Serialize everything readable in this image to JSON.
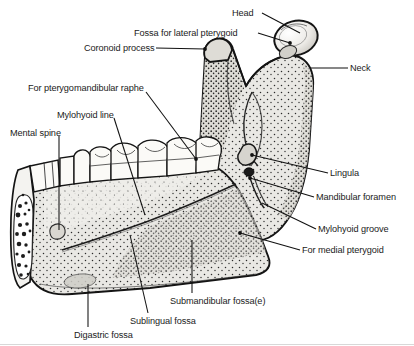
{
  "figure": {
    "view": "medial (lingual) surface of right half of mandible",
    "colors": {
      "background": "#ffffff",
      "ink": "#1b1b1b",
      "bone_fill": "#e8e7e3",
      "bone_fill_dark": "#cfcdc7",
      "tooth_fill": "#fbfaf7",
      "stipple": "#2a2a2a",
      "cancellous": "#1d1d1d",
      "border": "#d8d8d8"
    }
  },
  "labels": [
    {
      "id": "head",
      "text": "Head",
      "x": 232,
      "y": 8,
      "align": "left",
      "leader": [
        [
          262,
          13
        ],
        [
          300,
          33
        ]
      ]
    },
    {
      "id": "fossa-lateral-pterygoid",
      "text": "Fossa for lateral pterygoid",
      "x": 134,
      "y": 28,
      "align": "left",
      "leader": [
        [
          258,
          33
        ],
        [
          290,
          43
        ]
      ]
    },
    {
      "id": "coronoid-process",
      "text": "Coronoid process",
      "x": 84,
      "y": 43,
      "align": "left",
      "leader": [
        [
          156,
          48
        ],
        [
          205,
          49
        ]
      ]
    },
    {
      "id": "neck",
      "text": "Neck",
      "x": 350,
      "y": 63,
      "align": "left",
      "leader": [
        [
          348,
          68
        ],
        [
          310,
          68
        ]
      ]
    },
    {
      "id": "pterygomandibular-raphe",
      "text": "For pterygomandibular raphe",
      "x": 28,
      "y": 83,
      "align": "left",
      "leader": [
        [
          146,
          92
        ],
        [
          196,
          159
        ]
      ]
    },
    {
      "id": "mylohyoid-line",
      "text": "Mylohyoid line",
      "x": 57,
      "y": 110,
      "align": "left",
      "leader": [
        [
          114,
          118
        ],
        [
          145,
          215
        ]
      ]
    },
    {
      "id": "mental-spine",
      "text": "Mental spine",
      "x": 10,
      "y": 128,
      "align": "left",
      "leader": [
        [
          59,
          136
        ],
        [
          59,
          230
        ]
      ]
    },
    {
      "id": "lingula",
      "text": "Lingula",
      "x": 330,
      "y": 168,
      "align": "left",
      "leader": [
        [
          328,
          173
        ],
        [
          252,
          155
        ]
      ]
    },
    {
      "id": "mandibular-foramen",
      "text": "Mandibular foramen",
      "x": 316,
      "y": 192,
      "align": "left",
      "leader": [
        [
          314,
          197
        ],
        [
          250,
          178
        ]
      ]
    },
    {
      "id": "mylohyoid-groove",
      "text": "Mylohyoid groove",
      "x": 318,
      "y": 224,
      "align": "left",
      "leader": [
        [
          316,
          229
        ],
        [
          262,
          203
        ]
      ]
    },
    {
      "id": "for-medial-pterygoid",
      "text": "For medial pterygoid",
      "x": 302,
      "y": 245,
      "align": "left",
      "leader": [
        [
          300,
          250
        ],
        [
          240,
          233
        ]
      ]
    },
    {
      "id": "submandibular-fossa",
      "text": "Submandibular fossa(e)",
      "x": 170,
      "y": 296,
      "align": "left",
      "leader": [
        [
          192,
          293
        ],
        [
          192,
          240
        ]
      ]
    },
    {
      "id": "sublingual-fossa",
      "text": "Sublingual fossa",
      "x": 130,
      "y": 316,
      "align": "left",
      "leader": [
        [
          148,
          313
        ],
        [
          130,
          235
        ]
      ]
    },
    {
      "id": "digastric-fossa",
      "text": "Digastric fossa",
      "x": 74,
      "y": 330,
      "align": "left",
      "leader": [
        [
          88,
          327
        ],
        [
          88,
          284
        ]
      ]
    }
  ],
  "anatomy_parts": [
    {
      "id": "condylar-head",
      "name": "Head of condyle"
    },
    {
      "id": "condylar-neck",
      "name": "Neck"
    },
    {
      "id": "pterygoid-fovea",
      "name": "Fossa for lateral pterygoid"
    },
    {
      "id": "coronoid-process",
      "name": "Coronoid process"
    },
    {
      "id": "mandibular-notch",
      "name": "Mandibular notch"
    },
    {
      "id": "ramus",
      "name": "Ramus"
    },
    {
      "id": "lingula",
      "name": "Lingula"
    },
    {
      "id": "mandibular-foramen",
      "name": "Mandibular foramen"
    },
    {
      "id": "mylohyoid-groove",
      "name": "Mylohyoid groove"
    },
    {
      "id": "mylohyoid-line",
      "name": "Mylohyoid line"
    },
    {
      "id": "sublingual-fossa",
      "name": "Sublingual fossa"
    },
    {
      "id": "submandibular-fossa",
      "name": "Submandibular fossa"
    },
    {
      "id": "digastric-fossa",
      "name": "Digastric fossa"
    },
    {
      "id": "mental-spine",
      "name": "Mental spine"
    },
    {
      "id": "tooth-row",
      "name": "Tooth row"
    },
    {
      "id": "cut-surface",
      "name": "Cut symphyseal surface with cancellous bone"
    }
  ]
}
